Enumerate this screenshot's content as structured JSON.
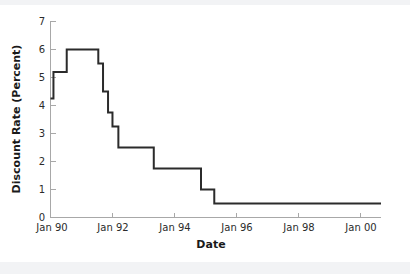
{
  "chart_data": {
    "type": "line",
    "subtype": "step",
    "title": "",
    "xlabel": "Date",
    "ylabel": "Discount Rate (Percent)",
    "xlim": [
      1990.0,
      2001.2
    ],
    "ylim": [
      0,
      7
    ],
    "grid": false,
    "legend": null,
    "x_tick_labels": [
      "Jan 90",
      "Jan 92",
      "Jan 94",
      "Jan 96",
      "Jan 98",
      "Jan 00"
    ],
    "x_tick_values": [
      1990.0,
      1992.0,
      1994.0,
      1996.0,
      1998.0,
      2000.0
    ],
    "y_tick_labels": [
      "0",
      "1",
      "2",
      "3",
      "4",
      "5",
      "6",
      "7"
    ],
    "y_tick_values": [
      0,
      1,
      2,
      3,
      4,
      5,
      6,
      7
    ],
    "line_color": "#2b2b2b",
    "series": [
      {
        "name": "Discount Rate",
        "x": [
          1990.0,
          1990.1,
          1990.1,
          1990.55,
          1990.55,
          1991.0,
          1991.0,
          1991.62,
          1991.62,
          1991.78,
          1991.78,
          1991.95,
          1991.95,
          1992.1,
          1992.1,
          1992.3,
          1992.3,
          1992.85,
          1992.85,
          1993.5,
          1993.5,
          1995.1,
          1995.1,
          1995.55,
          1995.55,
          2001.2
        ],
        "y": [
          4.25,
          4.25,
          5.2,
          5.2,
          6.0,
          6.0,
          6.0,
          6.0,
          5.5,
          5.5,
          4.5,
          4.5,
          3.75,
          3.75,
          3.25,
          3.25,
          2.5,
          2.5,
          2.5,
          2.5,
          1.75,
          1.75,
          1.0,
          1.0,
          0.5,
          0.5
        ]
      }
    ],
    "step_points": [
      {
        "date": "Jan 90",
        "value": 4.25
      },
      {
        "date": "Feb 90",
        "value": 5.2
      },
      {
        "date": "Jul 90",
        "value": 6.0
      },
      {
        "date": "Aug 91",
        "value": 5.5
      },
      {
        "date": "Oct 91",
        "value": 4.5
      },
      {
        "date": "Dec 91",
        "value": 3.75
      },
      {
        "date": "Feb 92",
        "value": 3.25
      },
      {
        "date": "Apr 92",
        "value": 2.5
      },
      {
        "date": "Jul 93",
        "value": 1.75
      },
      {
        "date": "Feb 95",
        "value": 1.0
      },
      {
        "date": "Jul 95",
        "value": 0.5
      }
    ]
  }
}
